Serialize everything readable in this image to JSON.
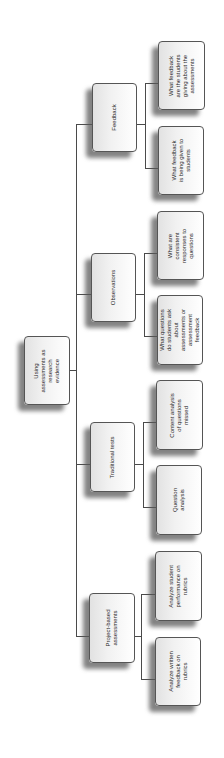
{
  "diagram": {
    "type": "hierarchy",
    "orientation": "rotated-90-ccw",
    "root": {
      "label": "Using assessments as research evidence"
    },
    "categories": [
      {
        "label": "Feedback",
        "children": [
          "What feedback are the students giving about the assessments",
          "What feedback is being given to students"
        ]
      },
      {
        "label": "Observations",
        "children": [
          "What are consistent responses to questions",
          "What questions do students ask about assessments or assessment feedback"
        ]
      },
      {
        "label": "Traditional tests",
        "children": [
          "Content analysis of questions missed",
          "Question analysis"
        ]
      },
      {
        "label": "Project-based assessments",
        "children": [
          "Analyze student performance on rubrics",
          "Analyze written feedback on rubrics"
        ]
      }
    ]
  },
  "colors": {
    "border": "#555555",
    "connector": "#4a4a4a",
    "shadow": "#8a8a8a",
    "fill": "#f1f1f1"
  }
}
